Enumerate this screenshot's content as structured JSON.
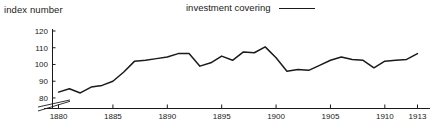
{
  "chart_data": {
    "type": "line",
    "title": "",
    "ylabel": "index number",
    "xlabel": "",
    "xlim": [
      1879.4,
      1913.6
    ],
    "ylim": [
      74,
      120
    ],
    "grid": false,
    "axis_break": true,
    "axis_break_note": "y-axis broken below 80",
    "yticks": [
      80,
      90,
      100,
      110,
      120
    ],
    "xticks": [
      1880,
      1885,
      1890,
      1895,
      1900,
      1905,
      1910,
      1913
    ],
    "legend": {
      "position": "top-center",
      "entries": [
        {
          "name": "investment covering",
          "marker": "solid-line",
          "color": "#1a1a1a"
        }
      ]
    },
    "series": [
      {
        "name": "investment covering",
        "color": "#1a1a1a",
        "x": [
          1880,
          1881,
          1882,
          1883,
          1884,
          1885,
          1886,
          1887,
          1888,
          1889,
          1890,
          1891,
          1892,
          1893,
          1894,
          1895,
          1896,
          1897,
          1898,
          1899,
          1900,
          1901,
          1902,
          1903,
          1904,
          1905,
          1906,
          1907,
          1908,
          1909,
          1910,
          1911,
          1912,
          1913
        ],
        "values": [
          83.5,
          85.5,
          83.0,
          86.5,
          87.5,
          90.0,
          95.5,
          102.0,
          102.5,
          103.5,
          104.5,
          106.5,
          106.5,
          99.0,
          101.0,
          105.0,
          102.5,
          107.5,
          107.0,
          110.5,
          104.0,
          96.0,
          97.0,
          96.5,
          99.5,
          102.5,
          104.5,
          103.0,
          102.5,
          98.0,
          102.0,
          102.5,
          103.0,
          106.5
        ]
      }
    ]
  },
  "labels": {
    "y_axis_title": "index number",
    "legend_label": "investment covering"
  }
}
